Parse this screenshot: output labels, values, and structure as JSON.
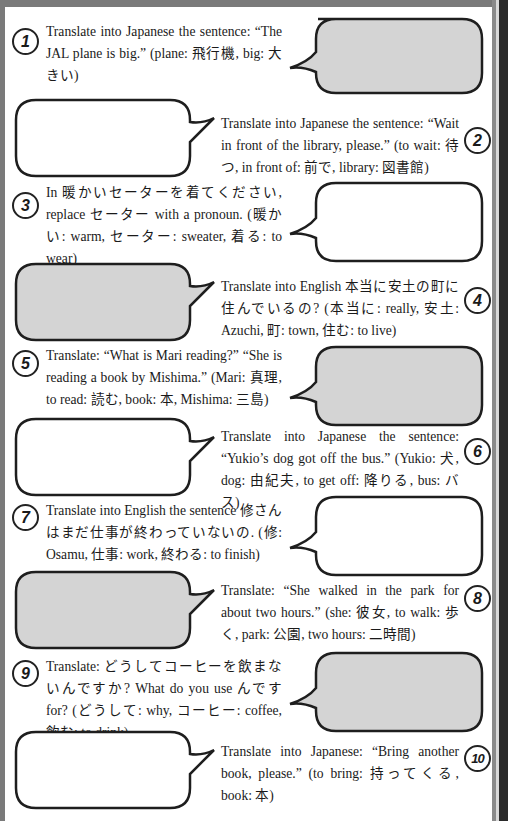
{
  "page": {
    "frame_color": "#7a7a7a",
    "bubble_gray": "#d4d4d4",
    "bubble_white": "#ffffff"
  },
  "exercises": [
    {
      "number": "1",
      "text": "Translate into Japanese the sentence: “The JAL plane is big.” (plane: 飛行機, big: 大きい)",
      "side": "left",
      "bubble": "gray"
    },
    {
      "number": "2",
      "text": "Translate into Japanese the sentence: “Wait in front of the library, please.” (to wait: 待つ, in front of: 前で, library: 図書館)",
      "side": "right",
      "bubble": "white"
    },
    {
      "number": "3",
      "text": "In 暖かいセーターを着てください, replace セーター with a pronoun. (暖かい: warm, セーター: sweater, 着る: to wear)",
      "side": "left",
      "bubble": "white"
    },
    {
      "number": "4",
      "text": "Translate into English 本当に安土の町に住んでいるの? (本当に: really, 安土: Azuchi, 町: town, 住む: to live)",
      "side": "right",
      "bubble": "gray"
    },
    {
      "number": "5",
      "text": "Translate: “What is Mari reading?” “She is reading a book by Mishima.” (Mari: 真理, to read: 読む, book: 本, Mishima: 三島)",
      "side": "left",
      "bubble": "gray"
    },
    {
      "number": "6",
      "text": "Translate into Japanese the sentence: “Yukio’s dog got off the bus.” (Yukio: 犬, dog: 由紀夫, to get off: 降りる, bus: バス)",
      "side": "right",
      "bubble": "white"
    },
    {
      "number": "7",
      "text": "Translate into English the sentence 修さんはまだ仕事が終わっていないの. (修: Osamu, 仕事: work, 終わる: to finish)",
      "side": "left",
      "bubble": "white"
    },
    {
      "number": "8",
      "text": "Translate: “She walked in the park for about two hours.” (she: 彼女, to walk: 歩く, park: 公園, two hours: 二時間)",
      "side": "right",
      "bubble": "gray"
    },
    {
      "number": "9",
      "text": "Translate: どうしてコーヒーを飲まないんですか? What do you use んです for? (どうして: why, コーヒー: coffee, 飲む: to drink)",
      "side": "left",
      "bubble": "gray"
    },
    {
      "number": "10",
      "text": "Translate into Japanese: “Bring another book, please.” (to bring: 持ってくる, book: 本)",
      "side": "right",
      "bubble": "white"
    }
  ]
}
